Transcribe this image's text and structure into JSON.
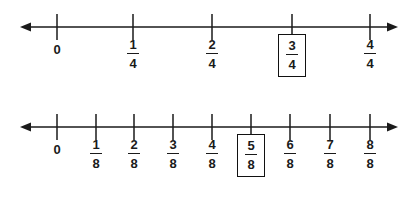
{
  "figure": {
    "background_color": "#ffffff",
    "ink_color": "#1a1a1a"
  },
  "chart_data": {
    "type": "line",
    "xlabel": "",
    "ylabel": "",
    "grid": false,
    "legend": false,
    "lines": [
      {
        "name": "fourths-number-line",
        "denominator": 4,
        "axis_y": 27,
        "arrow_left_x": 20,
        "arrow_right_x": 398,
        "tick_top_y": 14,
        "tick_bottom_y": 40,
        "ticks": [
          {
            "x": 57,
            "label": "0",
            "numerator": "0",
            "denominator": "",
            "is_fraction": false,
            "highlighted": false
          },
          {
            "x": 133,
            "label": "1/4",
            "numerator": "1",
            "denominator": "4",
            "is_fraction": true,
            "highlighted": false
          },
          {
            "x": 212,
            "label": "2/4",
            "numerator": "2",
            "denominator": "4",
            "is_fraction": true,
            "highlighted": false
          },
          {
            "x": 292,
            "label": "3/4",
            "numerator": "3",
            "denominator": "4",
            "is_fraction": true,
            "highlighted": true
          },
          {
            "x": 370,
            "label": "4/4",
            "numerator": "4",
            "denominator": "4",
            "is_fraction": true,
            "highlighted": false
          }
        ]
      },
      {
        "name": "eighths-number-line",
        "denominator": 8,
        "axis_y": 27,
        "arrow_left_x": 20,
        "arrow_right_x": 398,
        "tick_top_y": 14,
        "tick_bottom_y": 40,
        "ticks": [
          {
            "x": 57,
            "label": "0",
            "numerator": "0",
            "denominator": "",
            "is_fraction": false,
            "highlighted": false
          },
          {
            "x": 96,
            "label": "1/8",
            "numerator": "1",
            "denominator": "8",
            "is_fraction": true,
            "highlighted": false
          },
          {
            "x": 134,
            "label": "2/8",
            "numerator": "2",
            "denominator": "8",
            "is_fraction": true,
            "highlighted": false
          },
          {
            "x": 173,
            "label": "3/8",
            "numerator": "3",
            "denominator": "8",
            "is_fraction": true,
            "highlighted": false
          },
          {
            "x": 212,
            "label": "4/8",
            "numerator": "4",
            "denominator": "8",
            "is_fraction": true,
            "highlighted": false
          },
          {
            "x": 251,
            "label": "5/8",
            "numerator": "5",
            "denominator": "8",
            "is_fraction": true,
            "highlighted": true
          },
          {
            "x": 290,
            "label": "6/8",
            "numerator": "6",
            "denominator": "8",
            "is_fraction": true,
            "highlighted": false
          },
          {
            "x": 330,
            "label": "7/8",
            "numerator": "7",
            "denominator": "8",
            "is_fraction": true,
            "highlighted": false
          },
          {
            "x": 370,
            "label": "8/8",
            "numerator": "8",
            "denominator": "8",
            "is_fraction": true,
            "highlighted": false
          }
        ]
      }
    ]
  }
}
